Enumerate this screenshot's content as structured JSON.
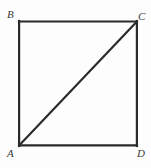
{
  "figure": {
    "kind": "geometry-diagram",
    "shape": "square-with-diagonal",
    "background_color": "#fdfdfd",
    "stroke_color": "#2a2a2a",
    "label_color": "#3a3a3a",
    "square": {
      "left": 18,
      "top": 21,
      "right": 138,
      "bottom": 146,
      "stroke_width": 2.2
    },
    "diagonal": {
      "name": "diagonal-AC",
      "from": "A",
      "to": "C",
      "x1": 19,
      "y1": 145,
      "x2": 137,
      "y2": 22,
      "stroke_width": 2.2
    },
    "sides": [
      {
        "name": "side-BC",
        "from": "B",
        "to": "C"
      },
      {
        "name": "side-CD",
        "from": "C",
        "to": "D"
      },
      {
        "name": "side-AD",
        "from": "A",
        "to": "D"
      },
      {
        "name": "side-AB",
        "from": "A",
        "to": "B"
      }
    ],
    "vertices": [
      {
        "id": "B",
        "label": "B",
        "position": "top-left"
      },
      {
        "id": "C",
        "label": "C",
        "position": "top-right"
      },
      {
        "id": "A",
        "label": "A",
        "position": "bottom-left"
      },
      {
        "id": "D",
        "label": "D",
        "position": "bottom-right"
      }
    ]
  }
}
